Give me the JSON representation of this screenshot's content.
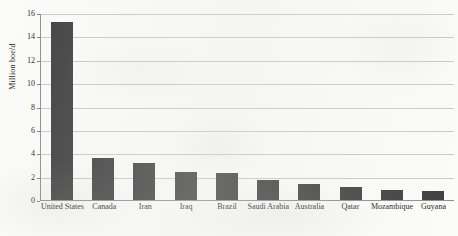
{
  "chart_data": {
    "type": "bar",
    "title": "",
    "xlabel": "",
    "ylabel": "Million boe/d",
    "ylim": [
      0,
      16
    ],
    "yticks": [
      "0",
      "2",
      "4",
      "6",
      "8",
      "10",
      "12",
      "14",
      "16"
    ],
    "grid": true,
    "legend": "none",
    "bar_color": "#3d3d3d",
    "categories": [
      "United States",
      "Canada",
      "Iran",
      "Iraq",
      "Brazil",
      "Saudi Arabia",
      "Australia",
      "Qatar",
      "Mozambique",
      "Guyana"
    ],
    "values": [
      15.2,
      3.6,
      3.2,
      2.4,
      2.3,
      1.7,
      1.4,
      1.1,
      0.85,
      0.8
    ]
  },
  "colors": {
    "bar": "#3d3d3d",
    "gridline": "#c9c9c6",
    "axis": "#8d8d89",
    "text": "#1b1b1b",
    "background": "#fbfbfa"
  }
}
